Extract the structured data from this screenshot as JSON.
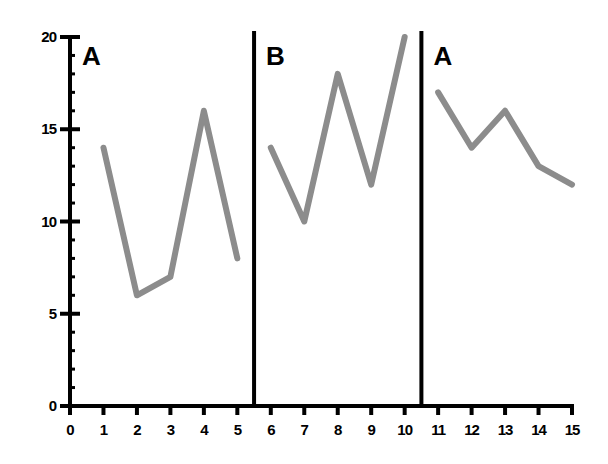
{
  "chart_data": {
    "type": "line",
    "title": "",
    "xlabel": "",
    "ylabel": "",
    "xlim": [
      0,
      15
    ],
    "ylim": [
      0,
      20
    ],
    "x_ticks": [
      0,
      1,
      2,
      3,
      4,
      5,
      6,
      7,
      8,
      9,
      10,
      11,
      12,
      13,
      14,
      15
    ],
    "y_ticks": [
      0,
      5,
      10,
      15,
      20
    ],
    "grid": false,
    "legend": null,
    "line_color": "#8c8c8c",
    "phases": [
      {
        "label": "A",
        "x_start": 0,
        "x_end": 5.5
      },
      {
        "label": "B",
        "x_start": 5.5,
        "x_end": 10.5
      },
      {
        "label": "A",
        "x_start": 10.5,
        "x_end": 15
      }
    ],
    "phase_dividers_x": [
      5.5,
      10.5
    ],
    "series": [
      {
        "name": "A (baseline)",
        "x": [
          1,
          2,
          3,
          4,
          5
        ],
        "values": [
          14,
          6,
          7,
          16,
          8
        ]
      },
      {
        "name": "B (intervention)",
        "x": [
          6,
          7,
          8,
          9,
          10
        ],
        "values": [
          14,
          10,
          18,
          12,
          20
        ]
      },
      {
        "name": "A (withdrawal)",
        "x": [
          11,
          12,
          13,
          14,
          15
        ],
        "values": [
          17,
          14,
          16,
          13,
          12
        ]
      }
    ]
  }
}
